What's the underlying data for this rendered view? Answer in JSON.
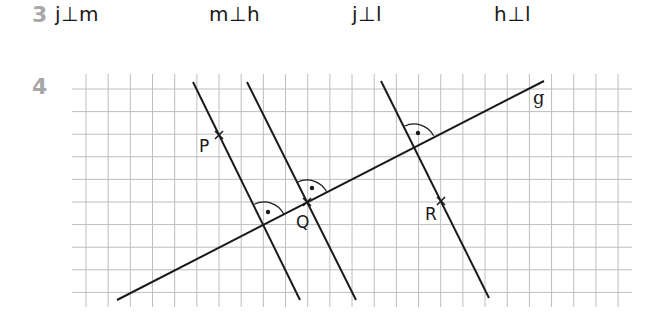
{
  "task3": {
    "number": "3",
    "answers": [
      "j⊥m",
      "m⊥h",
      "j⊥l",
      "h⊥l"
    ]
  },
  "task4": {
    "number": "4",
    "grid": {
      "columns": 25,
      "rows": 10
    },
    "line_g_label": "g",
    "points": {
      "P": "P",
      "Q": "Q",
      "R": "R"
    },
    "perpendicular_lines_count": 3,
    "right_angle_marks": 3,
    "colors": {
      "ink": "#1a1a1a",
      "grid": "#bdbdbd",
      "task_number": "#a8a8a8"
    }
  }
}
